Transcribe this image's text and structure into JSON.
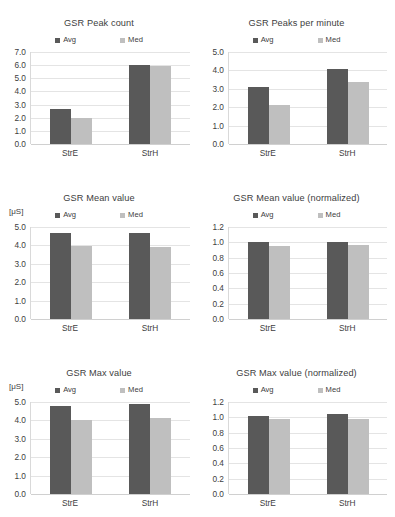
{
  "figure": {
    "series_names": [
      "Avg",
      "Med"
    ],
    "categories": [
      "StrE",
      "StrH"
    ],
    "colors": {
      "avg": "#595959",
      "med": "#bfbfbf",
      "grid": "#e4e4e4",
      "text": "#404040"
    },
    "unit_label": "[μS]"
  },
  "chart_data": [
    {
      "id": "gsr-peak-count",
      "type": "bar",
      "title": "GSR Peak count",
      "xlabel": "",
      "ylabel": "",
      "unit": "",
      "categories": [
        "StrE",
        "StrH"
      ],
      "series": [
        {
          "name": "Avg",
          "color": "#595959",
          "values": [
            2.7,
            6.0
          ]
        },
        {
          "name": "Med",
          "color": "#bfbfbf",
          "values": [
            2.0,
            5.95
          ]
        }
      ],
      "ylim": [
        0.0,
        7.0
      ],
      "yticks": [
        "7.0",
        "6.0",
        "5.0",
        "4.0",
        "3.0",
        "2.0",
        "1.0",
        "0.0"
      ],
      "ytick_values": [
        7.0,
        6.0,
        5.0,
        4.0,
        3.0,
        2.0,
        1.0,
        0.0
      ],
      "grid": true,
      "legend": "top"
    },
    {
      "id": "gsr-peaks-per-minute",
      "type": "bar",
      "title": "GSR Peaks per minute",
      "xlabel": "",
      "ylabel": "",
      "unit": "",
      "categories": [
        "StrE",
        "StrH"
      ],
      "series": [
        {
          "name": "Avg",
          "color": "#595959",
          "values": [
            3.1,
            4.05
          ]
        },
        {
          "name": "Med",
          "color": "#bfbfbf",
          "values": [
            2.1,
            3.35
          ]
        }
      ],
      "ylim": [
        0.0,
        5.0
      ],
      "yticks": [
        "5.0",
        "4.0",
        "3.0",
        "2.0",
        "1.0",
        "0.0"
      ],
      "ytick_values": [
        5.0,
        4.0,
        3.0,
        2.0,
        1.0,
        0.0
      ],
      "grid": true,
      "legend": "top"
    },
    {
      "id": "gsr-mean-value",
      "type": "bar",
      "title": "GSR Mean value",
      "xlabel": "",
      "ylabel": "",
      "unit": "[μS]",
      "categories": [
        "StrE",
        "StrH"
      ],
      "series": [
        {
          "name": "Avg",
          "color": "#595959",
          "values": [
            4.65,
            4.65
          ]
        },
        {
          "name": "Med",
          "color": "#bfbfbf",
          "values": [
            3.95,
            3.9
          ]
        }
      ],
      "ylim": [
        0.0,
        5.0
      ],
      "yticks": [
        "5.0",
        "4.0",
        "3.0",
        "2.0",
        "1.0",
        "0.0"
      ],
      "ytick_values": [
        5.0,
        4.0,
        3.0,
        2.0,
        1.0,
        0.0
      ],
      "grid": true,
      "legend": "top"
    },
    {
      "id": "gsr-mean-value-normalized",
      "type": "bar",
      "title": "GSR Mean value (normalized)",
      "xlabel": "",
      "ylabel": "",
      "unit": "",
      "categories": [
        "StrE",
        "StrH"
      ],
      "series": [
        {
          "name": "Avg",
          "color": "#595959",
          "values": [
            1.0,
            1.01
          ]
        },
        {
          "name": "Med",
          "color": "#bfbfbf",
          "values": [
            0.95,
            0.96
          ]
        }
      ],
      "ylim": [
        0.0,
        1.2
      ],
      "yticks": [
        "1.2",
        "1.0",
        "0.8",
        "0.6",
        "0.4",
        "0.2",
        "0.0"
      ],
      "ytick_values": [
        1.2,
        1.0,
        0.8,
        0.6,
        0.4,
        0.2,
        0.0
      ],
      "grid": true,
      "legend": "top"
    },
    {
      "id": "gsr-max-value",
      "type": "bar",
      "title": "GSR Max value",
      "xlabel": "",
      "ylabel": "",
      "unit": "[μS]",
      "categories": [
        "StrE",
        "StrH"
      ],
      "series": [
        {
          "name": "Avg",
          "color": "#595959",
          "values": [
            4.8,
            4.9
          ]
        },
        {
          "name": "Med",
          "color": "#bfbfbf",
          "values": [
            4.0,
            4.15
          ]
        }
      ],
      "ylim": [
        0.0,
        5.0
      ],
      "yticks": [
        "5.0",
        "4.0",
        "3.0",
        "2.0",
        "1.0",
        "0.0"
      ],
      "ytick_values": [
        5.0,
        4.0,
        3.0,
        2.0,
        1.0,
        0.0
      ],
      "grid": true,
      "legend": "top"
    },
    {
      "id": "gsr-max-value-normalized",
      "type": "bar",
      "title": "GSR Max value (normalized)",
      "xlabel": "",
      "ylabel": "",
      "unit": "",
      "categories": [
        "StrE",
        "StrH"
      ],
      "series": [
        {
          "name": "Avg",
          "color": "#595959",
          "values": [
            1.02,
            1.05
          ]
        },
        {
          "name": "Med",
          "color": "#bfbfbf",
          "values": [
            0.98,
            0.98
          ]
        }
      ],
      "ylim": [
        0.0,
        1.2
      ],
      "yticks": [
        "1.2",
        "1.0",
        "0.8",
        "0.6",
        "0.4",
        "0.2",
        "0.0"
      ],
      "ytick_values": [
        1.2,
        1.0,
        0.8,
        0.6,
        0.4,
        0.2,
        0.0
      ],
      "grid": true,
      "legend": "top"
    }
  ]
}
